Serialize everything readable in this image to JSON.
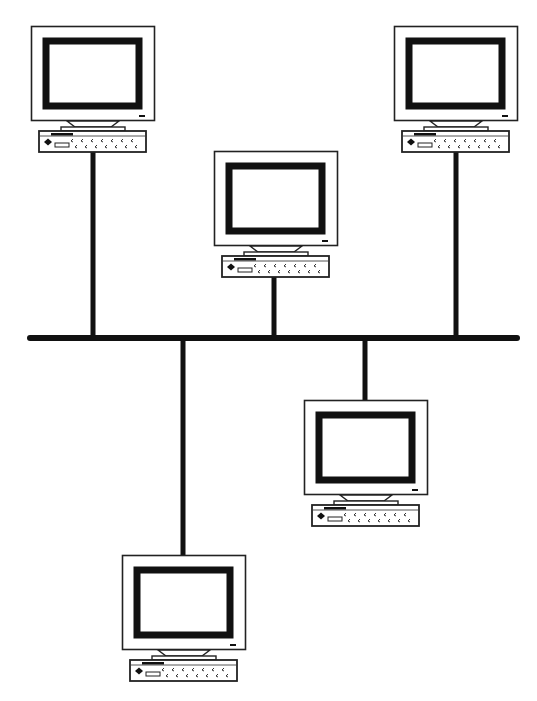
{
  "diagram": {
    "type": "network-topology",
    "topology": "bus",
    "colors": {
      "background": "#ffffff",
      "line": "#111111",
      "monitor_fill": "#ffffff",
      "screen_border": "#111111"
    },
    "bus": {
      "x1": 30,
      "x2": 517,
      "y": 338,
      "thickness": 6
    },
    "nodes": [
      {
        "id": "pc-1",
        "label": "Workstation 1",
        "x": 31,
        "y": 26,
        "side": "above",
        "drop_x": 93
      },
      {
        "id": "pc-2",
        "label": "Workstation 2",
        "x": 214,
        "y": 151,
        "side": "above",
        "drop_x": 274
      },
      {
        "id": "pc-3",
        "label": "Workstation 3",
        "x": 394,
        "y": 26,
        "side": "above",
        "drop_x": 456
      },
      {
        "id": "pc-4",
        "label": "Workstation 4",
        "x": 304,
        "y": 400,
        "side": "below",
        "drop_x": 365
      },
      {
        "id": "pc-5",
        "label": "Workstation 5",
        "x": 122,
        "y": 555,
        "side": "below",
        "drop_x": 183
      }
    ]
  }
}
